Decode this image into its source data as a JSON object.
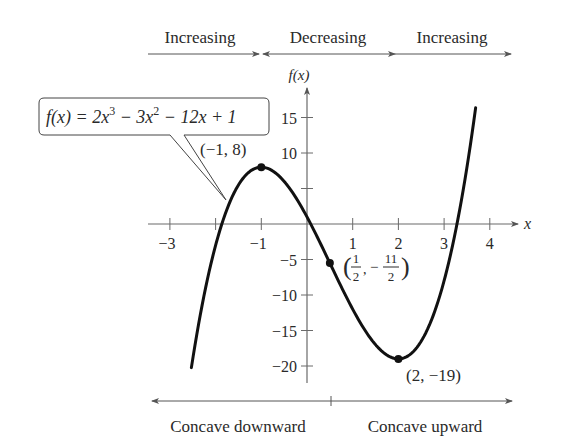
{
  "figure": {
    "function_label": {
      "prefix": "f(x) = 2x",
      "exp1": "3",
      "mid": " − 3x",
      "exp2": "2",
      "suffix": " − 12x + 1"
    },
    "coefficients": [
      2,
      -3,
      -12,
      1
    ],
    "x_axis_label": "x",
    "y_axis_label": "f(x)",
    "x_ticks": [
      {
        "value": -3,
        "label": "−3"
      },
      {
        "value": -2,
        "label": ""
      },
      {
        "value": -1,
        "label": "−1"
      },
      {
        "value": 1,
        "label": "1"
      },
      {
        "value": 2,
        "label": "2"
      },
      {
        "value": 3,
        "label": "3"
      },
      {
        "value": 4,
        "label": "4"
      }
    ],
    "y_ticks": [
      {
        "value": 15,
        "label": "15"
      },
      {
        "value": 10,
        "label": "10"
      },
      {
        "value": 5,
        "label": ""
      },
      {
        "value": -5,
        "label": "−5"
      },
      {
        "value": -10,
        "label": "−10"
      },
      {
        "value": -15,
        "label": "−15"
      },
      {
        "value": -20,
        "label": "−20"
      }
    ],
    "domain": [
      -2.53,
      3.69
    ],
    "points": {
      "max": {
        "x": -1,
        "y": 8,
        "label": "(−1, 8)"
      },
      "inflection": {
        "x": 0.5,
        "y": -5.5,
        "label_num_x": "1",
        "label_den_x": "2",
        "label_num_y": "11",
        "label_den_y": "2",
        "label_neg": "−"
      },
      "min": {
        "x": 2,
        "y": -19,
        "label": "(2, −19)"
      }
    },
    "monotonicity": [
      {
        "label": "Increasing"
      },
      {
        "label": "Decreasing"
      },
      {
        "label": "Increasing"
      }
    ],
    "concavity": [
      {
        "label": "Concave downward"
      },
      {
        "label": "Concave upward"
      }
    ],
    "colors": {
      "ink": "#2a2a2a",
      "curve": "#111111",
      "axis": "#6a6a6a"
    }
  }
}
